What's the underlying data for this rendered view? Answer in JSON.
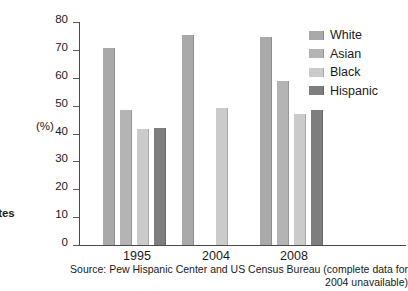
{
  "edge_label": "ates",
  "axis": {
    "y_unit_label": "(%)",
    "y_ticks": [
      "80",
      "70",
      "60",
      "50",
      "40",
      "30",
      "20",
      "10",
      "0"
    ]
  },
  "legend": {
    "items": [
      {
        "label": "White",
        "color": "#a9a9a9",
        "swatch_name": "legend-swatch-white"
      },
      {
        "label": "Asian",
        "color": "#b4b4b4",
        "swatch_name": "legend-swatch-asian"
      },
      {
        "label": "Black",
        "color": "#cbcbcb",
        "swatch_name": "legend-swatch-black"
      },
      {
        "label": "Hispanic",
        "color": "#7e7e7e",
        "swatch_name": "legend-swatch-hispanic"
      }
    ]
  },
  "source_note": "Source: Pew Hispanic Center and US Census Bureau (complete data for 2004 unavailable)",
  "chart_data": {
    "type": "bar",
    "title": "",
    "xlabel": "",
    "ylabel": "(%)",
    "ylim": [
      0,
      80
    ],
    "ytick_step": 10,
    "grid": false,
    "legend_position": "top-right",
    "categories": [
      "1995",
      "2004",
      "2008"
    ],
    "series": [
      {
        "name": "White",
        "color": "#a9a9a9",
        "values": [
          70.5,
          75.5,
          74.5
        ]
      },
      {
        "name": "Asian",
        "color": "#b4b4b4",
        "values": [
          48.5,
          null,
          59.0
        ]
      },
      {
        "name": "Black",
        "color": "#cbcbcb",
        "values": [
          41.5,
          49.0,
          47.0
        ]
      },
      {
        "name": "Hispanic",
        "color": "#7e7e7e",
        "values": [
          41.8,
          null,
          48.5
        ]
      }
    ],
    "annotations": [
      "2004 data incomplete: Asian and Hispanic bars absent"
    ]
  }
}
